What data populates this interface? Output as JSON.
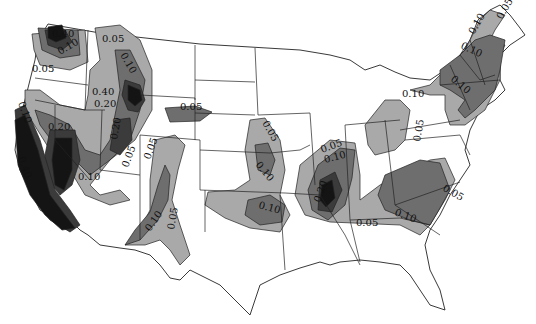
{
  "map": {
    "subject": "Contour map of the contiguous United States",
    "contour_levels": [
      "0.05",
      "0.10",
      "0.20",
      "0.40"
    ],
    "shading": {
      "0.05": "#a9a9a9",
      "0.10": "#6e6e6e",
      "0.20": "#3b3b3b",
      "0.40": "#141414"
    },
    "labels": [
      {
        "id": "wa-040",
        "text": "0.40"
      },
      {
        "id": "wa-010",
        "text": "0.10"
      },
      {
        "id": "or-005",
        "text": "0.05"
      },
      {
        "id": "id-005",
        "text": "0.05"
      },
      {
        "id": "id-010",
        "text": "0.10"
      },
      {
        "id": "mt-040",
        "text": "0.40"
      },
      {
        "id": "mt-020",
        "text": "0.20"
      },
      {
        "id": "ca-010",
        "text": "0.10"
      },
      {
        "id": "nv-020",
        "text": "0.20"
      },
      {
        "id": "ca-040",
        "text": "0.40"
      },
      {
        "id": "ut-020",
        "text": "0.20"
      },
      {
        "id": "ut-005",
        "text": "0.05"
      },
      {
        "id": "az-010",
        "text": "0.10"
      },
      {
        "id": "co-005",
        "text": "0.05"
      },
      {
        "id": "nm-010",
        "text": "0.10"
      },
      {
        "id": "nm-005",
        "text": "0.05"
      },
      {
        "id": "ne-005",
        "text": "0.05"
      },
      {
        "id": "ia-005",
        "text": "0.05"
      },
      {
        "id": "mo-010",
        "text": "0.10"
      },
      {
        "id": "ok-010",
        "text": "0.10"
      },
      {
        "id": "nm-mad-005",
        "text": "0.05"
      },
      {
        "id": "nm-mad-010",
        "text": "0.10"
      },
      {
        "id": "nm-mad-020",
        "text": "0.20"
      },
      {
        "id": "tn-005",
        "text": "0.05"
      },
      {
        "id": "sc-010",
        "text": "0.10"
      },
      {
        "id": "nc-005",
        "text": "0.05"
      },
      {
        "id": "oh-005",
        "text": "0.05"
      },
      {
        "id": "ny-010",
        "text": "0.10"
      },
      {
        "id": "ne-010a",
        "text": "0.10"
      },
      {
        "id": "ne-010b",
        "text": "0.10"
      },
      {
        "id": "ne-010c",
        "text": "0.10"
      },
      {
        "id": "me-005",
        "text": "0.05"
      }
    ]
  }
}
